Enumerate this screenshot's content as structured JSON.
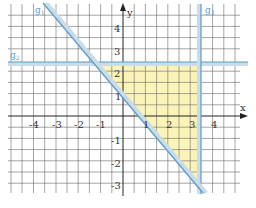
{
  "figure": {
    "type": "coordinate-system-with-lines",
    "axes": {
      "x_label": "x",
      "y_label": "y",
      "x_ticks": [
        "-4",
        "-3",
        "-2",
        "-1",
        "1",
        "2",
        "3",
        "4"
      ],
      "y_ticks": [
        "4",
        "3",
        "2",
        "1",
        "-1",
        "-2",
        "-3"
      ]
    },
    "lines": [
      {
        "name": "g1",
        "label_main": "g",
        "label_sub": "1",
        "kind": "falling diagonal"
      },
      {
        "name": "g2",
        "label_main": "g",
        "label_sub": "2",
        "kind": "horizontal"
      },
      {
        "name": "g3",
        "label_main": "g",
        "label_sub": "3",
        "kind": "vertical"
      }
    ],
    "region": {
      "description": "triangle bounded by g1, g2, g3",
      "fill": "#fbf3b0"
    },
    "colors": {
      "grid": "#555555",
      "axis": "#222222",
      "line": "#5a9cc8",
      "line_shade": "#c9dce8",
      "region": "#fbf3b0"
    }
  }
}
